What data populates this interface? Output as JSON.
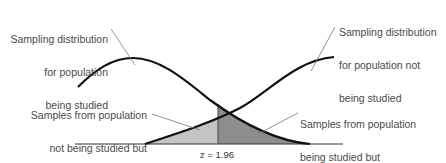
{
  "diagram": {
    "title": "",
    "labels": {
      "studied_distribution": {
        "lines": [
          "Sampling distribution",
          "for population",
          "being studied"
        ]
      },
      "not_studied_distribution": {
        "lines": [
          "Sampling distribution",
          "for population not",
          "being studied"
        ]
      },
      "type2_error": {
        "lines": [
          "Samples from population",
          "not being studied but",
          "erroneously accepted as",
          "being from studied",
          "population"
        ]
      },
      "type1_error": {
        "lines": [
          "Samples from population",
          "being studied but",
          "erroneously rejected (5%)"
        ]
      }
    },
    "critical_value_label": "z = 1.96",
    "colors": {
      "curve": "#111111",
      "leader_line": "#777777",
      "light_region": "#c4c4c4",
      "dark_region": "#8e8e8e",
      "baseline": "#333333",
      "text": "#4a4a4a"
    }
  }
}
